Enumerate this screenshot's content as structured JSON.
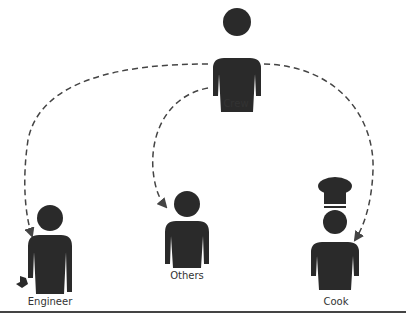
{
  "diagram": {
    "type": "hierarchy",
    "nodes": [
      {
        "id": "crew",
        "label": "Crew",
        "icon": "person-icon"
      },
      {
        "id": "engineer",
        "label": "Engineer",
        "icon": "person-with-wrench-icon"
      },
      {
        "id": "others",
        "label": "Others",
        "icon": "person-icon"
      },
      {
        "id": "cook",
        "label": "Cook",
        "icon": "person-with-chef-hat-icon"
      }
    ],
    "edges": [
      {
        "from": "crew",
        "to": "engineer",
        "style": "dashed-arrow"
      },
      {
        "from": "crew",
        "to": "others",
        "style": "dashed-arrow"
      },
      {
        "from": "crew",
        "to": "cook",
        "style": "dashed-arrow"
      }
    ],
    "colors": {
      "figure": "#2a2a2a",
      "line": "#444444",
      "background": "#ffffff"
    }
  }
}
